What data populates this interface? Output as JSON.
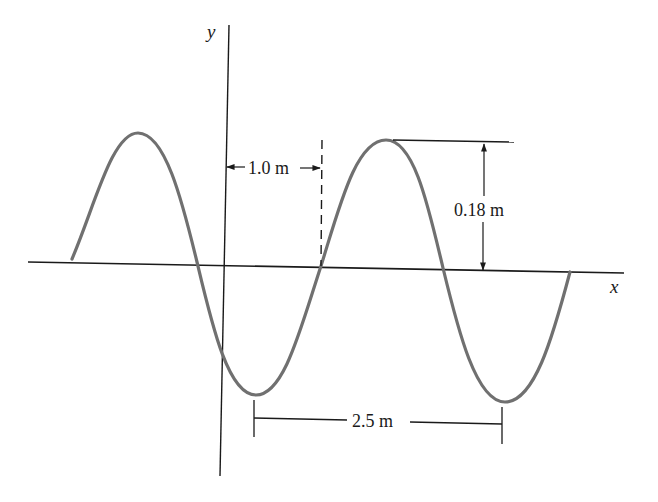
{
  "diagram": {
    "type": "transverse-wave",
    "axes": {
      "x_label": "x",
      "y_label": "y"
    },
    "annotations": {
      "offset_label": "1.0 m",
      "amplitude_label": "0.18 m",
      "wavelength_label": "2.5 m"
    },
    "wave": {
      "amplitude_m": 0.18,
      "wavelength_m": 2.5,
      "offset_from_y_axis_m": 1.0,
      "curve_color": "#707070",
      "axis_color": "#1a1a1a"
    }
  }
}
